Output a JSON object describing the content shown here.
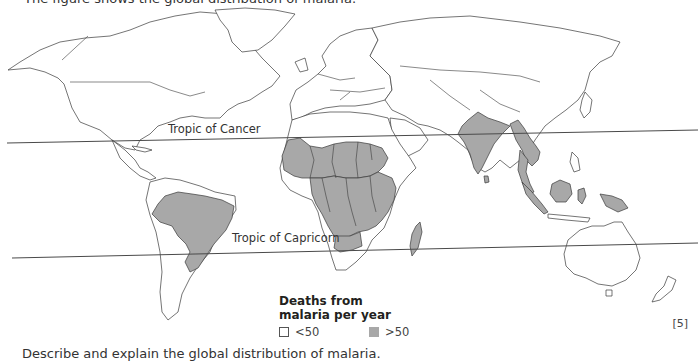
{
  "question": {
    "intro_text": "The figure shows the global distribution of malaria.",
    "footer_text": "Describe and explain the global distribution of malaria.",
    "marks": "[5]"
  },
  "map": {
    "lines": [
      {
        "name": "Tropic of Cancer",
        "label": "Tropic of Cancer"
      },
      {
        "name": "Tropic of Capricorn",
        "label": "Tropic of Capricorn"
      }
    ],
    "colors": {
      "shaded": "#a8a8a8",
      "unshaded": "#ffffff",
      "outline": "#3a3a3a"
    },
    "shaded_regions": [
      "Brazil",
      "West Africa",
      "Central Africa",
      "East Africa",
      "Madagascar",
      "India",
      "Myanmar",
      "Southeast Asia mainland",
      "Sumatra",
      "Borneo",
      "Sulawesi",
      "Papua New Guinea"
    ]
  },
  "legend": {
    "title_line1": "Deaths from",
    "title_line2": "malaria per year",
    "items": [
      {
        "label": "<50",
        "color": "#ffffff"
      },
      {
        "label": ">50",
        "color": "#a8a8a8"
      }
    ]
  }
}
